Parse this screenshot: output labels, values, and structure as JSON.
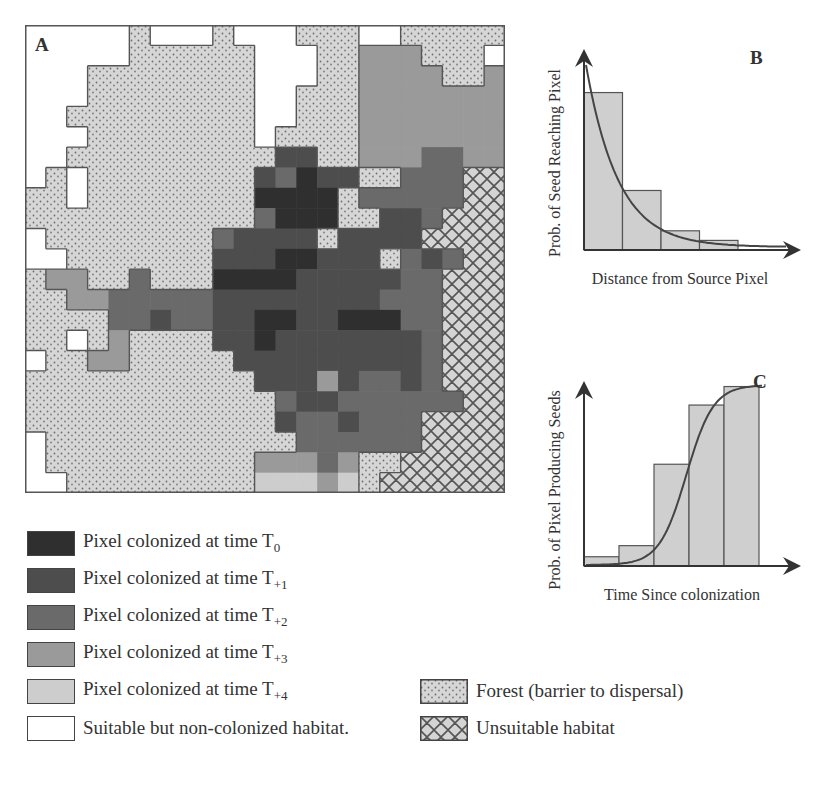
{
  "figure": {
    "panel_labels": {
      "a": "A",
      "b": "B",
      "c": "C"
    },
    "colors": {
      "T0": "#2f2f2f",
      "T1": "#4d4d4d",
      "T2": "#6a6a6a",
      "T3": "#9a9a9a",
      "T4": "#cdcdcd",
      "white": "#ffffff",
      "forest_bg": "#d4d4d4",
      "forest_dot": "#7a7a7a",
      "unsuitable_bg": "#d2d2d2",
      "unsuitable_line": "#555555",
      "border": "#555555"
    },
    "map": {
      "cols": 23,
      "rows": 23,
      "legend_codes": {
        "W": "white",
        "F": "forest",
        "U": "unsuitable",
        "0": "T0",
        "1": "T1",
        "2": "T2",
        "3": "T3",
        "4": "T4"
      },
      "grid": [
        "WWWWWFWWWFWWWFFFWWFFFFF",
        "WWWWWFFFFFFWWWFF333FFFW",
        "WWWFFFFFFFFWWWFF3333FF3",
        "WWWFFFFFFFFWWFFF3333333",
        "WWFFFFFFFFFWWFFF3333333",
        "WWWFFFFFFFFWFFFF3333333",
        "WWFFFFFFFFFF11FF3332233U",
        "WFWFFFFFFFF12011FF222UU",
        "FFWFFFFFFFF0000F22222UU",
        "FFFFFFFFFFF2000FF112UUU",
        "WFFFFFFFF21111F1111UUUU",
        "WWFFFFFFF11100111F212UU",
        "F33FF2FFF00001111122UUU",
        "FF3322222111111112 22UUU",
        "FFFF221221100110 0022UUU",
        "FFWF3FFFF11011111112UUU",
        "WFF33FFFFF111111111 2UUU",
        "FFFFFFFFFFF11131221 2UUU",
        "FFFFFFFFFFFF211222222UUU",
        "FFFFFFFFFFFF122122 2UUUU",
        "WFFFFFFFFFFFF222222UUUU",
        "WFFFFFFFFFF33323FFUUUUU",
        "WWFFFFFFFFF44434FUUUUUU"
      ]
    },
    "legend_left": [
      {
        "key": "T0",
        "label": "Pixel colonized at time T",
        "sub": "0"
      },
      {
        "key": "T1",
        "label": "Pixel colonized at time T",
        "sub": "+1"
      },
      {
        "key": "T2",
        "label": "Pixel colonized at time T",
        "sub": "+2"
      },
      {
        "key": "T3",
        "label": "Pixel colonized at time T",
        "sub": "+3"
      },
      {
        "key": "T4",
        "label": "Pixel colonized at time T",
        "sub": "+4"
      },
      {
        "key": "white",
        "label": "Suitable but non-colonized habitat.",
        "sub": ""
      }
    ],
    "legend_right": [
      {
        "key": "forest",
        "label": "Forest (barrier to dispersal)"
      },
      {
        "key": "unsuitable",
        "label": "Unsuitable habitat"
      }
    ]
  },
  "chart_data": [
    {
      "panel": "B",
      "type": "bar",
      "title": "",
      "xlabel": "Distance from Source Pixel",
      "ylabel": "Prob. of Seed Reaching Pixel",
      "categories": [
        "1",
        "2",
        "3",
        "4"
      ],
      "values": [
        0.82,
        0.31,
        0.1,
        0.05
      ],
      "curve": "negative exponential decay fitted over bars",
      "ylim": [
        0,
        1
      ],
      "grid": false,
      "axis_ticks": "none (arrowed axes)"
    },
    {
      "panel": "C",
      "type": "bar",
      "title": "",
      "xlabel": "Time Since colonization",
      "ylabel": "Prob. of Pixel Producing Seeds",
      "categories": [
        "1",
        "2",
        "3",
        "4",
        "5"
      ],
      "values": [
        0.05,
        0.11,
        0.55,
        0.87,
        0.97
      ],
      "curve": "sigmoid (logistic) curve fitted over bars",
      "ylim": [
        0,
        1
      ],
      "grid": false,
      "axis_ticks": "none (arrowed axes)"
    }
  ]
}
